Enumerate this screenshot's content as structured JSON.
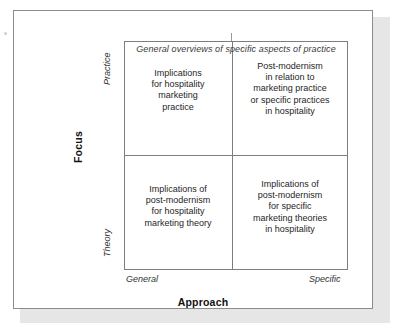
{
  "figure": {
    "type": "2x2-matrix-diagram",
    "caption": "General overviews of specific aspects of practice",
    "axes": {
      "y": {
        "title": "Focus",
        "high_label": "Practice",
        "low_label": "Theory"
      },
      "x": {
        "title": "Approach",
        "low_label": "General",
        "high_label": "Specific"
      }
    },
    "quadrants": {
      "top_left": "Implications\nfor hospitality\nmarketing\npractice",
      "top_right": "Post-modernism\nin relation to\nmarketing practice\nor specific practices\nin hospitality",
      "bottom_left": "Implications of\npost-modernism\nfor hospitality\nmarketing theory",
      "bottom_right": "Implications of\npost-modernism\nfor specific\nmarketing theories\nin hospitality"
    },
    "colors": {
      "frame_border": "#8c8c8c",
      "matrix_border": "#7d7d7d",
      "text": "#262626",
      "background": "#ffffff",
      "shadow": "#e6e6e6"
    }
  }
}
